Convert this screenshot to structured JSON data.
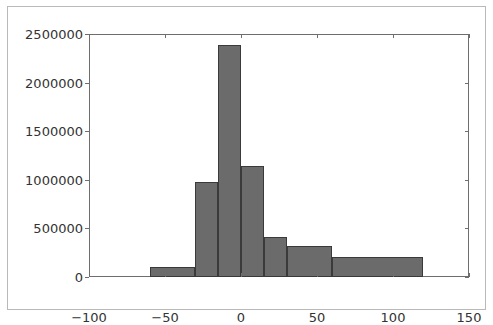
{
  "figure": {
    "background_color": "#ffffff",
    "frame_color": "#b9b9b9",
    "axis_color": "#6e6e6e"
  },
  "chart_data": {
    "type": "bar",
    "title": "",
    "xlabel": "",
    "ylabel": "",
    "xlim": [
      -100,
      150
    ],
    "ylim": [
      0,
      2500000
    ],
    "grid": false,
    "legend": null,
    "bar_color": "#6b6b6b",
    "bar_edge_color": "#3a3a3a",
    "xticks": [
      -100,
      -50,
      0,
      50,
      100,
      150
    ],
    "xtick_labels": [
      "-100",
      "-50",
      "0",
      "50",
      "100",
      "150"
    ],
    "yticks": [
      0,
      500000,
      1000000,
      1500000,
      2000000,
      2500000
    ],
    "ytick_labels": [
      "0",
      "500000",
      "1000000",
      "1500000",
      "2000000",
      "2500000"
    ],
    "bins": [
      {
        "x0": -60,
        "x1": -30,
        "value": 100000
      },
      {
        "x0": -30,
        "x1": -15,
        "value": 980000
      },
      {
        "x0": -15,
        "x1": 0,
        "value": 2390000
      },
      {
        "x0": 0,
        "x1": 15,
        "value": 1140000
      },
      {
        "x0": 15,
        "x1": 30,
        "value": 410000
      },
      {
        "x0": 30,
        "x1": 60,
        "value": 320000
      },
      {
        "x0": 60,
        "x1": 120,
        "value": 210000
      }
    ],
    "categories": [
      "-60..-30",
      "-30..-15",
      "-15..0",
      "0..15",
      "15..30",
      "30..60",
      "60..120"
    ],
    "values": [
      100000,
      980000,
      2390000,
      1140000,
      410000,
      320000,
      210000
    ]
  }
}
